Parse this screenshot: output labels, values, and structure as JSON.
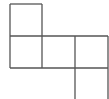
{
  "diagram": {
    "type": "grid-net",
    "stroke_color": "#555555",
    "stroke_width": 1.3,
    "background": "#ffffff",
    "lines": [
      {
        "x1": 10,
        "y1": 4,
        "x2": 42,
        "y2": 4
      },
      {
        "x1": 10,
        "y1": 4,
        "x2": 10,
        "y2": 68
      },
      {
        "x1": 42,
        "y1": 4,
        "x2": 42,
        "y2": 68
      },
      {
        "x1": 10,
        "y1": 36,
        "x2": 108,
        "y2": 36
      },
      {
        "x1": 10,
        "y1": 68,
        "x2": 108,
        "y2": 68
      },
      {
        "x1": 75,
        "y1": 36,
        "x2": 75,
        "y2": 99
      },
      {
        "x1": 108,
        "y1": 36,
        "x2": 108,
        "y2": 99
      }
    ]
  }
}
